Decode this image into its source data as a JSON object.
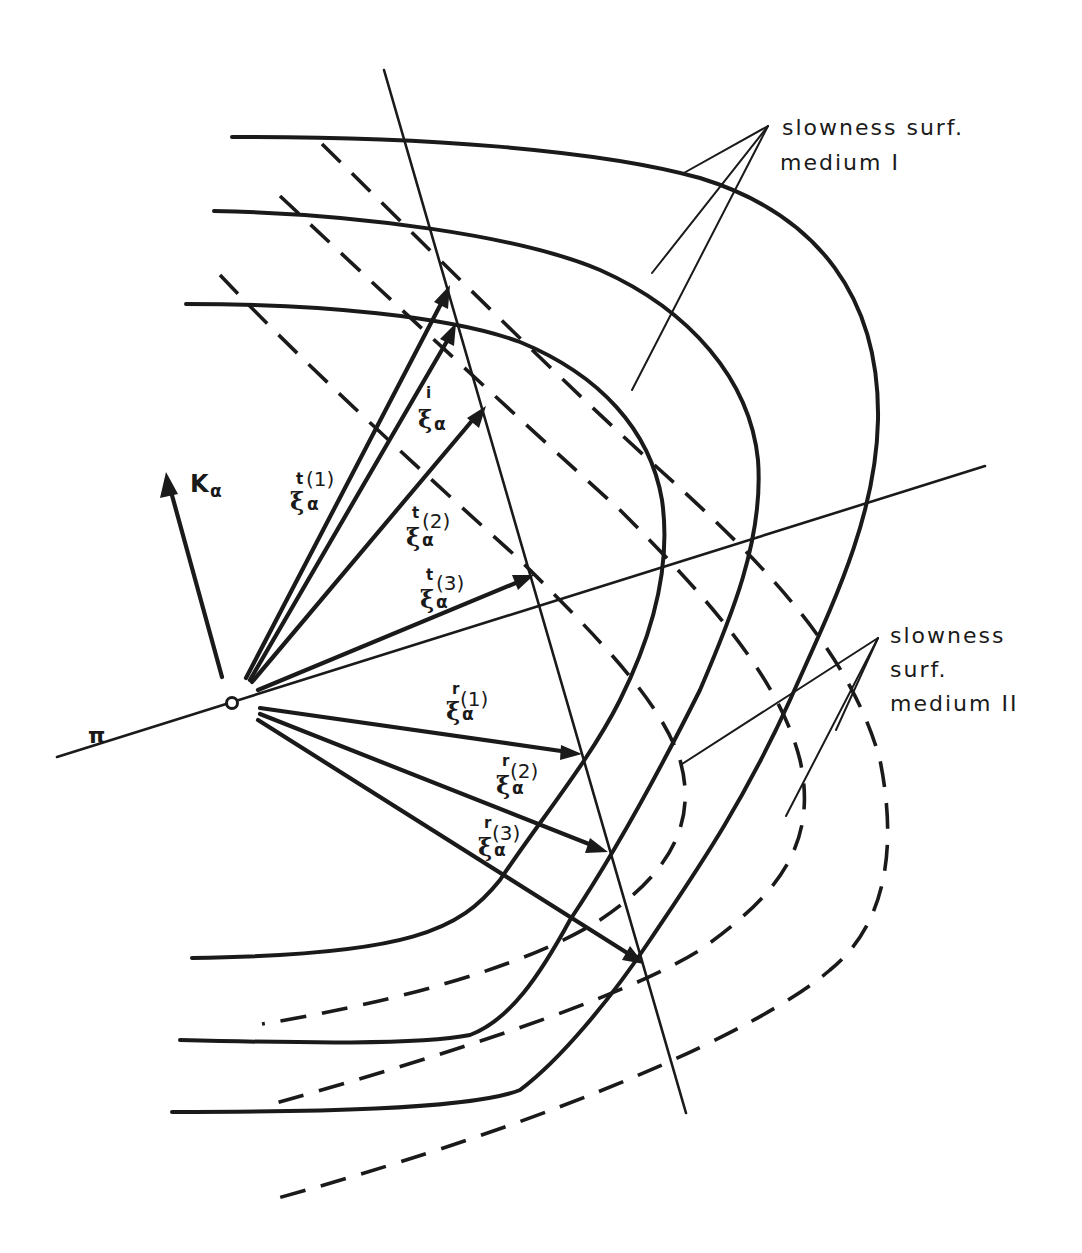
{
  "figure": {
    "type": "slowness-surface refraction/reflection construction",
    "plane_label": "π",
    "normal_vector_label": {
      "symbol": "K",
      "subscript": "α"
    },
    "callouts": {
      "medium_I": {
        "line1": "slowness  surf.",
        "line2": "medium  I"
      },
      "medium_II": {
        "line1": "slowness",
        "line2": "surf.",
        "line3": "medium  II"
      }
    },
    "vectors": {
      "incident": {
        "symbol": "ξ",
        "superscript": "i",
        "subscript": "α",
        "index": ""
      },
      "transmitted": [
        {
          "symbol": "ξ",
          "superscript": "t",
          "subscript": "α",
          "index": "(1)"
        },
        {
          "symbol": "ξ",
          "superscript": "t",
          "subscript": "α",
          "index": "(2)"
        },
        {
          "symbol": "ξ",
          "superscript": "t",
          "subscript": "α",
          "index": "(3)"
        }
      ],
      "reflected": [
        {
          "symbol": "ξ",
          "superscript": "r",
          "subscript": "α",
          "index": "(1)"
        },
        {
          "symbol": "ξ",
          "superscript": "r",
          "subscript": "α",
          "index": "(2)"
        },
        {
          "symbol": "ξ",
          "superscript": "r",
          "subscript": "α",
          "index": "(3)"
        }
      ]
    },
    "surfaces": {
      "medium_I_count": 3,
      "medium_II_count": 3,
      "medium_I_style": "solid",
      "medium_II_style": "dashed"
    },
    "stroke_color": "#1a1a1a",
    "background_color": "#ffffff"
  }
}
